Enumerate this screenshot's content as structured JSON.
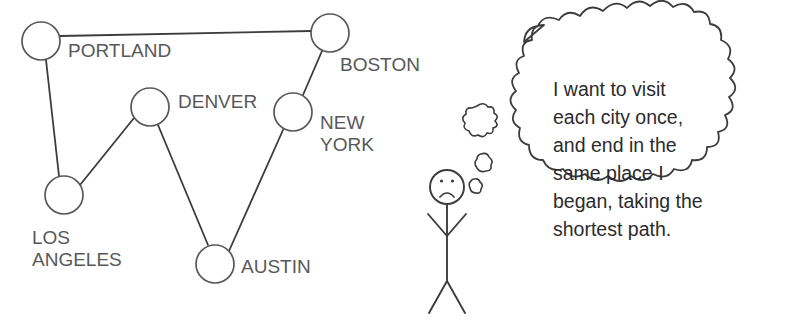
{
  "diagram": {
    "title_text": "",
    "colors": {
      "stroke": "#58585a",
      "edge": "#3c3c3e",
      "node_fill": "#ffffff",
      "label": "#58585a",
      "bubble_stroke": "#3c3c3e",
      "bubble_text": "#2b2b2d",
      "figure_stroke": "#3c3c3e",
      "background": "#ffffff"
    },
    "graph": {
      "node_radius": 19,
      "nodes": [
        {
          "id": "portland",
          "label": "PORTLAND",
          "cx": 41,
          "cy": 41,
          "label_x": 68,
          "label_y": 57,
          "label_anchor": "start"
        },
        {
          "id": "boston",
          "label": "BOSTON",
          "cx": 330,
          "cy": 33,
          "label_x": 340,
          "label_y": 71,
          "label_anchor": "start"
        },
        {
          "id": "denver",
          "label": "DENVER",
          "cx": 150,
          "cy": 107,
          "label_x": 178,
          "label_y": 108,
          "label_anchor": "start"
        },
        {
          "id": "new-york",
          "label": "NEW YORK",
          "cx": 293,
          "cy": 112,
          "label_x": 320,
          "label_y": 129,
          "label_anchor": "start"
        },
        {
          "id": "los-angeles",
          "label": "LOS ANGELES",
          "cx": 64,
          "cy": 195,
          "label_x": 32,
          "label_y": 244,
          "label_anchor": "start"
        },
        {
          "id": "austin",
          "label": "AUSTIN",
          "cx": 215,
          "cy": 264,
          "label_x": 241,
          "label_y": 273,
          "label_anchor": "start"
        }
      ],
      "multiline_labels": {
        "new-york": [
          "NEW",
          "YORK"
        ],
        "los-angeles": [
          "LOS",
          "ANGELES"
        ]
      },
      "edges": [
        {
          "from": "portland",
          "to": "boston"
        },
        {
          "from": "portland",
          "to": "los-angeles"
        },
        {
          "from": "los-angeles",
          "to": "denver"
        },
        {
          "from": "denver",
          "to": "austin"
        },
        {
          "from": "austin",
          "to": "new-york"
        },
        {
          "from": "new-york",
          "to": "boston"
        }
      ]
    },
    "figure": {
      "name": "sad-stick-figure",
      "head_cx": 447,
      "head_cy": 187,
      "head_r": 17,
      "expression": "frown",
      "eye_left_x": 441,
      "eye_left_y": 181,
      "eye_right_x": 453,
      "eye_right_y": 181
    },
    "thought_puffs": [
      {
        "cx": 482,
        "cy": 120,
        "r": 14
      },
      {
        "cx": 484,
        "cy": 163,
        "r": 9
      },
      {
        "cx": 476,
        "cy": 186,
        "r": 7
      }
    ],
    "thought_bubble": {
      "lines": [
        "I want to visit",
        "each city once,",
        "and end in the",
        "same place I",
        "began, taking the",
        "shortest path."
      ],
      "text_x": 553,
      "text_start_y": 96,
      "line_height": 28
    }
  }
}
